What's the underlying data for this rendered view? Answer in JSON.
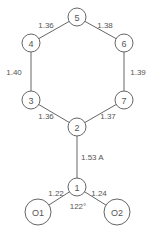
{
  "figure": {
    "type": "molecular-structure",
    "colors": {
      "line": "#666666",
      "text": "#555555",
      "background": "#ffffff"
    }
  },
  "atoms": [
    {
      "id": "5",
      "label": "5"
    },
    {
      "id": "4",
      "label": "4"
    },
    {
      "id": "6",
      "label": "6"
    },
    {
      "id": "3",
      "label": "3"
    },
    {
      "id": "7",
      "label": "7"
    },
    {
      "id": "2",
      "label": "2"
    },
    {
      "id": "1",
      "label": "1"
    },
    {
      "id": "O1",
      "label": "O1"
    },
    {
      "id": "O2",
      "label": "O2"
    }
  ],
  "bonds": [
    {
      "from": "4",
      "to": "5",
      "length": "1.36"
    },
    {
      "from": "5",
      "to": "6",
      "length": "1.38"
    },
    {
      "from": "3",
      "to": "4",
      "length": "1.40"
    },
    {
      "from": "6",
      "to": "7",
      "length": "1.39"
    },
    {
      "from": "2",
      "to": "3",
      "length": "1.36"
    },
    {
      "from": "2",
      "to": "7",
      "length": "1.37"
    },
    {
      "from": "1",
      "to": "2",
      "length": "1.53 A"
    },
    {
      "from": "1",
      "to": "O1",
      "length": "1.22"
    },
    {
      "from": "1",
      "to": "O2",
      "length": "1.24"
    }
  ],
  "angles": [
    {
      "vertex": "1",
      "value": "122°"
    }
  ]
}
